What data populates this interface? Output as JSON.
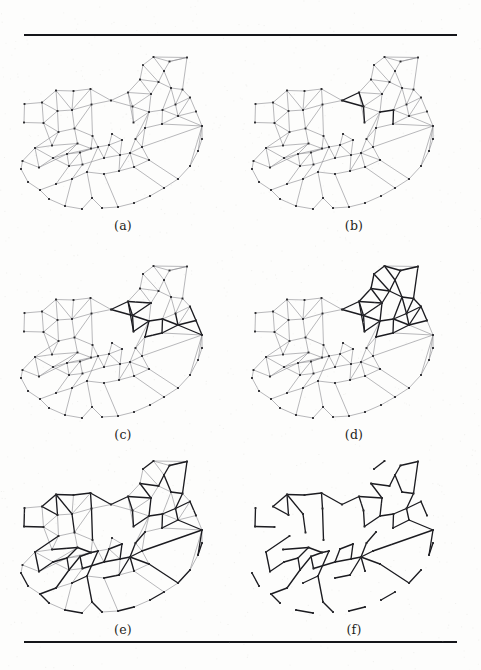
{
  "figure": {
    "type": "multi-panel-graph-figure",
    "panel_count": 6,
    "rules": {
      "top_label": "top-rule",
      "bottom_label": "bottom-rule"
    },
    "colors": {
      "background": "#fdfdfc",
      "edge_light": "#8b8b90",
      "edge_bold": "#1b1b20",
      "node": "#2a2a2e",
      "rule": "#15161a",
      "caption": "#1d1d20"
    }
  },
  "panels": [
    {
      "id": "a",
      "caption": "(a)",
      "description": "base geometric graph, all edges light"
    },
    {
      "id": "b",
      "caption": "(b)",
      "description": "graph with a small set of bold edges near centre"
    },
    {
      "id": "c",
      "caption": "(c)",
      "description": "graph with a medium set of bold edges, centre-right cluster"
    },
    {
      "id": "d",
      "caption": "(d)",
      "description": "graph with a large set of bold edges spanning left and right"
    },
    {
      "id": "e",
      "caption": "(e)",
      "description": "graph with nearly all edges bold, spanning structure visible"
    },
    {
      "id": "f",
      "caption": "(f)",
      "description": "extracted spanning tree only, light edges removed"
    }
  ],
  "chart_data": {
    "type": "scatter",
    "title": "",
    "xlabel": "",
    "ylabel": "",
    "xlim": [
      0,
      222
    ],
    "ylim": [
      0,
      175
    ],
    "grid": false,
    "legend": null,
    "nodes": [
      [
        12.5,
        56.0
      ],
      [
        12.0,
        74.5
      ],
      [
        30.0,
        54.5
      ],
      [
        31.5,
        75.0
      ],
      [
        44.0,
        42.5
      ],
      [
        45.5,
        63.0
      ],
      [
        46.5,
        84.0
      ],
      [
        40.0,
        97.5
      ],
      [
        61.5,
        43.0
      ],
      [
        60.0,
        62.0
      ],
      [
        62.5,
        80.5
      ],
      [
        65.5,
        95.5
      ],
      [
        78.5,
        41.0
      ],
      [
        79.5,
        56.5
      ],
      [
        80.5,
        88.0
      ],
      [
        79.0,
        100.5
      ],
      [
        23.0,
        100.0
      ],
      [
        10.5,
        113.0
      ],
      [
        27.0,
        119.5
      ],
      [
        41.0,
        110.0
      ],
      [
        55.0,
        106.0
      ],
      [
        57.0,
        118.0
      ],
      [
        68.0,
        104.5
      ],
      [
        70.5,
        116.5
      ],
      [
        86.0,
        99.0
      ],
      [
        92.0,
        110.0
      ],
      [
        97.0,
        97.0
      ],
      [
        108.0,
        107.0
      ],
      [
        99.0,
        52.5
      ],
      [
        116.0,
        44.5
      ],
      [
        120.5,
        58.5
      ],
      [
        121.5,
        74.5
      ],
      [
        128.0,
        31.5
      ],
      [
        131.0,
        17.0
      ],
      [
        141.5,
        9.0
      ],
      [
        157.5,
        13.5
      ],
      [
        152.0,
        23.0
      ],
      [
        146.5,
        34.0
      ],
      [
        139.0,
        46.0
      ],
      [
        159.0,
        40.0
      ],
      [
        175.0,
        9.5
      ],
      [
        170.5,
        41.5
      ],
      [
        178.0,
        49.5
      ],
      [
        163.5,
        56.5
      ],
      [
        150.5,
        62.0
      ],
      [
        137.0,
        64.0
      ],
      [
        133.0,
        80.0
      ],
      [
        150.0,
        76.0
      ],
      [
        166.0,
        68.0
      ],
      [
        184.0,
        63.5
      ],
      [
        190.0,
        78.0
      ],
      [
        123.5,
        91.0
      ],
      [
        118.0,
        105.0
      ],
      [
        130.0,
        99.0
      ],
      [
        137.0,
        112.0
      ],
      [
        122.0,
        119.0
      ],
      [
        107.0,
        123.0
      ],
      [
        92.0,
        126.0
      ],
      [
        75.0,
        124.0
      ],
      [
        60.0,
        131.0
      ],
      [
        44.0,
        136.0
      ],
      [
        28.0,
        142.0
      ],
      [
        16.0,
        134.0
      ],
      [
        9.0,
        121.0
      ],
      [
        37.0,
        151.0
      ],
      [
        53.0,
        158.0
      ],
      [
        70.0,
        161.0
      ],
      [
        80.0,
        150.0
      ],
      [
        90.0,
        160.0
      ],
      [
        106.0,
        159.0
      ],
      [
        122.0,
        155.0
      ],
      [
        138.0,
        148.0
      ],
      [
        152.0,
        140.0
      ],
      [
        166.0,
        131.0
      ],
      [
        178.0,
        118.0
      ],
      [
        186.0,
        103.0
      ],
      [
        190.0,
        91.0
      ],
      [
        100.0,
        86.0
      ],
      [
        110.0,
        92.0
      ]
    ],
    "edge_counts": {
      "a": {
        "light": 146,
        "bold": 0
      },
      "b": {
        "light": 140,
        "bold": 6
      },
      "c": {
        "light": 126,
        "bold": 20
      },
      "d": {
        "light": 104,
        "bold": 42
      },
      "e": {
        "light": 68,
        "bold": 78
      },
      "f": {
        "light": 0,
        "bold": 78
      }
    }
  }
}
